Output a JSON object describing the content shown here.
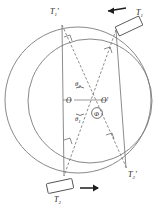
{
  "figure": {
    "type": "geometric-diagram",
    "background_color": "#ffffff",
    "stroke_color": "#6e6e6e",
    "label_color": "#1c1c1c"
  },
  "circles": [
    {
      "name": "outer-circle",
      "center_label": "O",
      "cx": 78,
      "cy": 100,
      "r": 73
    },
    {
      "name": "inner-circle",
      "center_label": "O'",
      "cx": 90,
      "cy": 101,
      "r": 62
    }
  ],
  "centers": [
    {
      "id": "O",
      "label": "O",
      "x": 72,
      "y": 97
    },
    {
      "id": "Op",
      "label": "O'",
      "x": 100,
      "y": 97
    }
  ],
  "angles": [
    {
      "id": "theta2",
      "label": "θ",
      "subscript": "2",
      "x": 80,
      "y": 80
    },
    {
      "id": "theta1",
      "label": "θ",
      "subscript": "1",
      "x": 80,
      "y": 116
    },
    {
      "id": "phi",
      "label": "Φ",
      "subscript": "",
      "x": 98,
      "y": 113
    }
  ],
  "endpoints": [
    {
      "id": "T1p",
      "label": "T",
      "subscript": "1",
      "prime": "'",
      "x": 55,
      "y": 10
    },
    {
      "id": "T2p",
      "label": "T",
      "subscript": "2",
      "prime": "'",
      "x": 131,
      "y": 175
    }
  ],
  "bars": [
    {
      "id": "T1",
      "label": "T",
      "subscript": "1",
      "prime": "",
      "label_x": 139,
      "label_y": 14,
      "rect": {
        "cx": 129,
        "cy": 26,
        "w": 26,
        "h": 10,
        "rotation": -25
      },
      "arrow": {
        "name": "arrow-left",
        "x1": 125,
        "y1": 8,
        "x2": 103,
        "y2": 11,
        "direction": "left"
      }
    },
    {
      "id": "T2",
      "label": "T",
      "subscript": "2",
      "prime": "",
      "label_x": 58,
      "label_y": 202,
      "rect": {
        "cx": 60,
        "cy": 186,
        "w": 26,
        "h": 10,
        "rotation": -12
      },
      "arrow": {
        "name": "arrow-right",
        "x1": 80,
        "y1": 188,
        "x2": 100,
        "y2": 188,
        "direction": "right"
      }
    }
  ],
  "chords": [
    {
      "id": "chord-solid-1",
      "style": "solid",
      "from": "T1p",
      "to": "T2-bottom"
    },
    {
      "id": "chord-solid-2",
      "style": "solid",
      "from": "T1-top",
      "to": "T2p"
    },
    {
      "id": "chord-dashed-1",
      "style": "dashed",
      "from": "T1p",
      "to": "T2p"
    },
    {
      "id": "chord-dashed-2",
      "style": "dashed",
      "from": "T1-top",
      "to": "T2-bottom"
    }
  ],
  "perpendicular_marks": [
    {
      "id": "perp-top-left",
      "x": 68,
      "y": 40
    },
    {
      "id": "perp-top-right",
      "x": 108,
      "y": 52
    },
    {
      "id": "perp-bottom-left",
      "x": 70,
      "y": 143
    },
    {
      "id": "perp-bottom-right",
      "x": 110,
      "y": 138
    }
  ]
}
